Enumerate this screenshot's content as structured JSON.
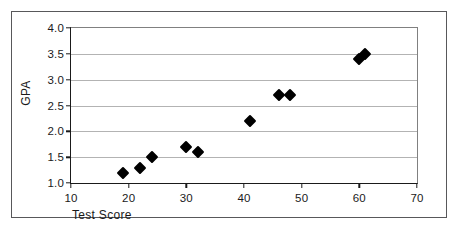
{
  "chart_data": {
    "type": "scatter",
    "title": "",
    "xlabel": "Test Score",
    "ylabel": "GPA",
    "xlim": [
      10,
      70
    ],
    "ylim": [
      1.0,
      4.0
    ],
    "xticks": [
      "10",
      "20",
      "30",
      "40",
      "50",
      "60",
      "70"
    ],
    "xtick_values": [
      10,
      20,
      30,
      40,
      50,
      60,
      70
    ],
    "yticks": [
      "1.0",
      "1.5",
      "2.0",
      "2.5",
      "3.0",
      "3.5",
      "4.0"
    ],
    "ytick_values": [
      1.0,
      1.5,
      2.0,
      2.5,
      3.0,
      3.5,
      4.0
    ],
    "grid": "horizontal",
    "legend": "none",
    "marker": "filled-diamond",
    "marker_color": "#000000",
    "points": [
      {
        "x": 19,
        "y": 1.2
      },
      {
        "x": 22,
        "y": 1.3
      },
      {
        "x": 24,
        "y": 1.5
      },
      {
        "x": 30,
        "y": 1.7
      },
      {
        "x": 32,
        "y": 1.6
      },
      {
        "x": 41,
        "y": 2.2
      },
      {
        "x": 46,
        "y": 2.7
      },
      {
        "x": 48,
        "y": 2.7
      },
      {
        "x": 60,
        "y": 3.4
      },
      {
        "x": 61,
        "y": 3.5
      }
    ]
  }
}
